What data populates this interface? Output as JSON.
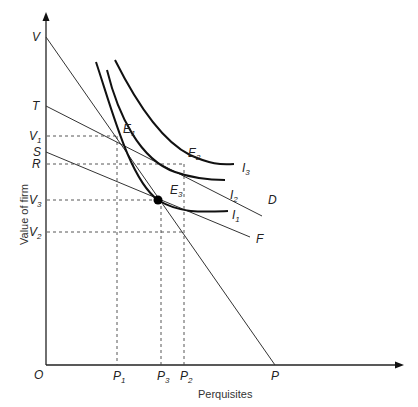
{
  "diagram": {
    "y_axis_title": "Value of firm",
    "x_axis_title": "Perquisites",
    "origin_label": "O",
    "y_labels": [
      {
        "id": "V",
        "text": "V",
        "sub": ""
      },
      {
        "id": "T",
        "text": "T",
        "sub": ""
      },
      {
        "id": "V1",
        "text": "V",
        "sub": "1"
      },
      {
        "id": "S",
        "text": "S",
        "sub": ""
      },
      {
        "id": "R",
        "text": "R",
        "sub": ""
      },
      {
        "id": "V3",
        "text": "V",
        "sub": "3"
      },
      {
        "id": "V2",
        "text": "V",
        "sub": "2"
      }
    ],
    "x_labels": [
      {
        "id": "P1",
        "text": "P",
        "sub": "1"
      },
      {
        "id": "P3",
        "text": "P",
        "sub": "3"
      },
      {
        "id": "P2",
        "text": "P",
        "sub": "2"
      },
      {
        "id": "P",
        "text": "P",
        "sub": ""
      }
    ],
    "points": [
      {
        "id": "E1",
        "text": "E",
        "sub": "1"
      },
      {
        "id": "E2",
        "text": "E",
        "sub": "2"
      },
      {
        "id": "E3",
        "text": "E",
        "sub": "3"
      }
    ],
    "curves": [
      {
        "id": "I1",
        "text": "I",
        "sub": "1"
      },
      {
        "id": "I2",
        "text": "I",
        "sub": "2"
      },
      {
        "id": "I3",
        "text": "I",
        "sub": "3"
      }
    ],
    "lines": [
      {
        "id": "VP",
        "from": "V",
        "to": "P"
      },
      {
        "id": "TD",
        "from": "T",
        "to": "D",
        "end_label": "D"
      },
      {
        "id": "SF",
        "from": "S",
        "to": "F",
        "end_label": "F"
      }
    ]
  }
}
